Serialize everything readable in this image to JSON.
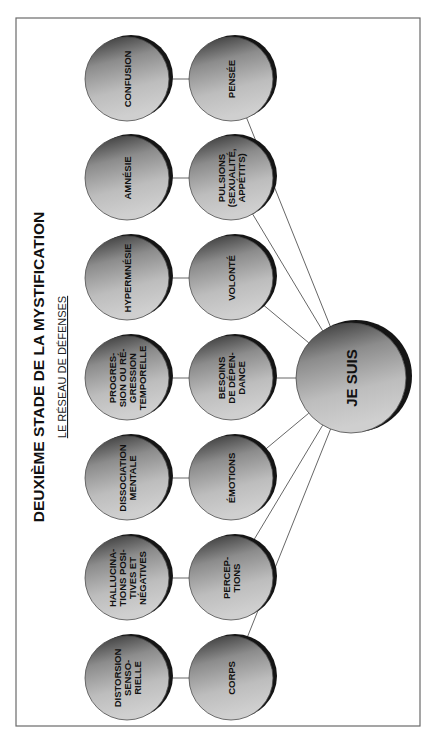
{
  "diagram": {
    "title": "DEUXIÈME STADE DE LA MYSTIFICATION",
    "subtitle": "LE RÉSEAU DE DÉFENSES",
    "center": {
      "label": "JE SUIS"
    },
    "defenses": [
      {
        "lines": [
          "CONFUSION"
        ]
      },
      {
        "lines": [
          "AMNÉSIE"
        ]
      },
      {
        "lines": [
          "HYPERMNÉSIE"
        ]
      },
      {
        "lines": [
          "PROGRES-",
          "SION OU RÉ-",
          "GRESSION",
          "TEMPORELLE"
        ]
      },
      {
        "lines": [
          "DISSOCIATION",
          "MENTALE"
        ]
      },
      {
        "lines": [
          "HALLUCINA-",
          "TIONS POSI-",
          "TIVES ET",
          "NÉGATIVES"
        ]
      },
      {
        "lines": [
          "DISTORSION",
          "SENSO-",
          "RIELLE"
        ]
      }
    ],
    "faculties": [
      {
        "lines": [
          "PENSÉE"
        ]
      },
      {
        "lines": [
          "PULSIONS",
          "(SEXUALITÉ,",
          "APPÉTITS)"
        ]
      },
      {
        "lines": [
          "VOLONTÉ"
        ]
      },
      {
        "lines": [
          "BESOINS",
          "DE DÉPEN-",
          "DANCE"
        ]
      },
      {
        "lines": [
          "ÉMOTIONS"
        ]
      },
      {
        "lines": [
          "PERCEP-",
          "TIONS"
        ]
      },
      {
        "lines": [
          "CORPS"
        ]
      }
    ],
    "colors": {
      "circle_dark": "#3a3a3a",
      "circle_light": "#d4d4d4",
      "shadow": "#151515",
      "line": "#555555",
      "frame": "#6a6a6a"
    }
  }
}
